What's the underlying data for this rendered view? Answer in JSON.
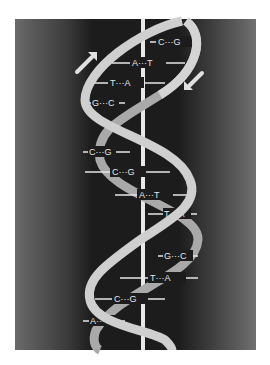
{
  "figure": {
    "colors": {
      "page_background": "#ffffff",
      "panel_dark": "#1c1c1c",
      "panel_edge": "#6a6a6a",
      "backbone_ribbon": "#cfcfcf",
      "axis_line": "#e8e8e8",
      "label_text": "#e6e6e6"
    },
    "arrows": {
      "left": {
        "direction": "up-right",
        "label": "5'→3' strand direction"
      },
      "right": {
        "direction": "down-left",
        "label": "3'→5' strand direction"
      }
    },
    "base_pairs": [
      {
        "left": "C",
        "right": "G",
        "bond": "C···G"
      },
      {
        "left": "A",
        "right": "T",
        "bond": "A···T"
      },
      {
        "left": "T",
        "right": "A",
        "bond": "T···A"
      },
      {
        "left": "G",
        "right": "C",
        "bond": "G···C"
      },
      {
        "left": "C",
        "right": "G",
        "bond": "C···G"
      },
      {
        "left": "C",
        "right": "G",
        "bond": "C···G"
      },
      {
        "left": "A",
        "right": "T",
        "bond": "A···T"
      },
      {
        "left": "T",
        "right": "A",
        "bond": "T···A"
      },
      {
        "left": "G",
        "right": "C",
        "bond": "G···C"
      },
      {
        "left": "T",
        "right": "A",
        "bond": "T···A"
      },
      {
        "left": "C",
        "right": "G",
        "bond": "C···G"
      },
      {
        "left": "A",
        "right": "T",
        "bond": "A···T"
      }
    ]
  }
}
